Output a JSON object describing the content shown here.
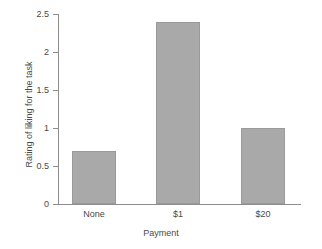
{
  "chart_data": {
    "type": "bar",
    "title": "",
    "subtitle": "",
    "categories": [
      "None",
      "$1",
      "$20"
    ],
    "values": [
      0.7,
      2.4,
      1.0
    ],
    "series": [
      {
        "name": "Rating of liking for the task",
        "values": [
          0.7,
          2.4,
          1.0
        ]
      }
    ],
    "xlabel": "Payment",
    "ylabel": "Rating of liking for the task",
    "ylim": [
      0,
      2.5
    ],
    "yticks": [
      "0",
      "0.5",
      "1",
      "1.5",
      "2",
      "2.5"
    ],
    "ytick_values": [
      0,
      0.5,
      1,
      1.5,
      2,
      2.5
    ],
    "grid": false,
    "legend": false,
    "legend_position": "none",
    "bar_color": "#a9a9a9",
    "bar_edge_color": "#9a9a9a",
    "axis_color": "#8d8d8d",
    "text_color": "#4a4a4a",
    "background_color": "#ffffff"
  }
}
